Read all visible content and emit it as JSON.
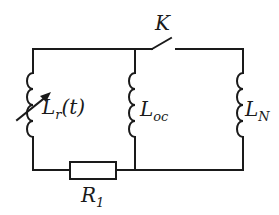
{
  "diagram": {
    "type": "circuit-schematic",
    "stroke_color": "#1a1a1a",
    "background": "#ffffff",
    "components": {
      "switch": {
        "label": "K",
        "state": "open"
      },
      "variable_inductor": {
        "label_main": "L",
        "label_sub": "r",
        "label_suffix": "(t)"
      },
      "inductor_oc": {
        "label_main": "L",
        "label_sub": "oc"
      },
      "inductor_n": {
        "label_main": "L",
        "label_sub": "N"
      },
      "resistor": {
        "label_main": "R",
        "label_sub": "1"
      }
    },
    "topology": [
      "Left branch: variable inductor L_r(t) in series with resistor R_1",
      "Middle branch: inductor L_oc",
      "Right branch: inductor L_N, connected via switch K"
    ]
  }
}
